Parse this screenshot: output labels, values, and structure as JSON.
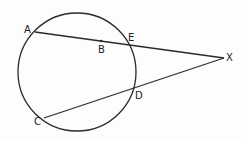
{
  "diagram": {
    "type": "geometry-secants",
    "circle": {
      "cx": 77,
      "cy": 72,
      "r": 59
    },
    "points": {
      "A": {
        "label": "A",
        "x": 35,
        "y": 32
      },
      "B": {
        "label": "B",
        "x": 101,
        "y": 41
      },
      "E": {
        "label": "E",
        "x": 134,
        "y": 45
      },
      "X": {
        "label": "X",
        "x": 224,
        "y": 58
      },
      "D": {
        "label": "D",
        "x": 134,
        "y": 89
      },
      "C": {
        "label": "C",
        "x": 44,
        "y": 118
      }
    },
    "segments": [
      [
        "A",
        "X"
      ],
      [
        "C",
        "X"
      ]
    ],
    "stroke_color": "#2a2a2a"
  }
}
